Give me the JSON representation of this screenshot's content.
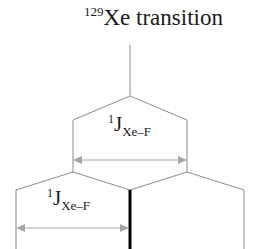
{
  "figure": {
    "title": {
      "superscript": "129",
      "text": "Xe transition"
    },
    "couplings": [
      {
        "id": "top",
        "pre_superscript": "1",
        "symbol": "J",
        "subscript": "Xe–F"
      },
      {
        "id": "bottom",
        "pre_superscript": "1",
        "symbol": "J",
        "subscript": "Xe–F"
      }
    ],
    "colors": {
      "background": "#ffffff",
      "tree_line": "#8c8c8c",
      "arrow": "#a6a6a6",
      "bold_peak": "#000000",
      "text": "#1a1a1a"
    }
  }
}
